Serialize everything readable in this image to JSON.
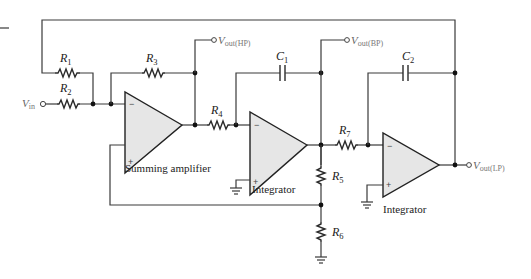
{
  "diagram": {
    "type": "state-variable filter circuit",
    "components": {
      "R1": {
        "name": "R",
        "sub": "1"
      },
      "R2": {
        "name": "R",
        "sub": "2"
      },
      "R3": {
        "name": "R",
        "sub": "3"
      },
      "R4": {
        "name": "R",
        "sub": "4"
      },
      "R5": {
        "name": "R",
        "sub": "5"
      },
      "R6": {
        "name": "R",
        "sub": "6"
      },
      "R7": {
        "name": "R",
        "sub": "7"
      },
      "C1": {
        "name": "C",
        "sub": "1"
      },
      "C2": {
        "name": "C",
        "sub": "2"
      }
    },
    "terminals": {
      "vin": {
        "name": "V",
        "sub": "in"
      },
      "vout_hp": {
        "name": "V",
        "sub": "out",
        "suffix": "(HP)"
      },
      "vout_bp": {
        "name": "V",
        "sub": "out",
        "suffix": "(BP)"
      },
      "vout_lp": {
        "name": "V",
        "sub": "out",
        "suffix": "(LP)"
      }
    },
    "stages": {
      "summing": {
        "caption": "Summing amplifier",
        "inv": "−",
        "noninv": "+"
      },
      "integrator1": {
        "caption": "Integrator",
        "inv": "−",
        "noninv": "+"
      },
      "integrator2": {
        "caption": "Integrator",
        "inv": "−",
        "noninv": "+"
      }
    }
  }
}
